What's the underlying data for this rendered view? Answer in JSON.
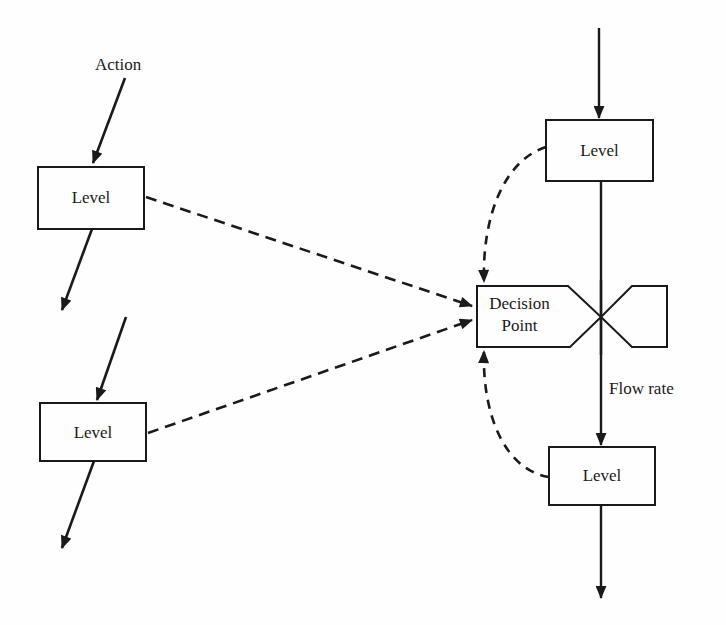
{
  "diagram": {
    "title": "",
    "labels": {
      "action": "Action",
      "flow_rate": "Flow rate"
    },
    "nodes": [
      {
        "id": "level-left-top",
        "label": "Level"
      },
      {
        "id": "level-left-bottom",
        "label": "Level"
      },
      {
        "id": "level-right-top",
        "label": "Level"
      },
      {
        "id": "level-right-bottom",
        "label": "Level"
      }
    ],
    "decision": {
      "line1": "Decision",
      "line2": "Point"
    },
    "edges": [
      {
        "from": "action",
        "to": "level-left-top",
        "style": "solid"
      },
      {
        "from": "level-left-top",
        "to": "out",
        "style": "solid"
      },
      {
        "from": "in",
        "to": "level-left-bottom",
        "style": "solid"
      },
      {
        "from": "level-left-bottom",
        "to": "out",
        "style": "solid"
      },
      {
        "from": "in",
        "to": "level-right-top",
        "style": "solid"
      },
      {
        "from": "level-right-top",
        "to": "level-right-bottom",
        "style": "solid",
        "label": "Flow rate"
      },
      {
        "from": "level-right-bottom",
        "to": "out",
        "style": "solid"
      },
      {
        "from": "level-left-top",
        "to": "decision-point",
        "style": "dashed"
      },
      {
        "from": "level-left-bottom",
        "to": "decision-point",
        "style": "dashed"
      },
      {
        "from": "level-right-top",
        "to": "decision-point",
        "style": "dashed"
      },
      {
        "from": "level-right-bottom",
        "to": "decision-point",
        "style": "dashed"
      }
    ],
    "colors": {
      "ink": "#1a1a1a",
      "background": "#fefefe"
    }
  }
}
